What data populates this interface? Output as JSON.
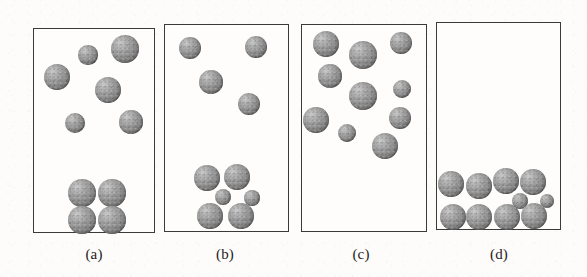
{
  "figure": {
    "width": 587,
    "height": 277,
    "background_color": "#fdfcfa",
    "panel_border_color": "#3a3a3a",
    "sphere_color": "#8d8d8d",
    "sphere_highlight_color": "#c9c9c9",
    "sphere_shadow_color": "#5e5e5e"
  },
  "panels": [
    {
      "id": "panel-a",
      "label": "(a)",
      "box": {
        "x": 33,
        "y": 28,
        "w": 122,
        "h": 205
      },
      "label_pos": {
        "x": 94,
        "y": 246
      },
      "particle_count": 10,
      "particles": [
        {
          "cx": 88,
          "cy": 55,
          "r": 9.7,
          "group": "dispersed"
        },
        {
          "cx": 125,
          "cy": 49,
          "r": 14,
          "group": "dispersed"
        },
        {
          "cx": 57,
          "cy": 77,
          "r": 13.3,
          "group": "dispersed"
        },
        {
          "cx": 108,
          "cy": 90,
          "r": 13.3,
          "group": "dispersed"
        },
        {
          "cx": 75,
          "cy": 123,
          "r": 10,
          "group": "dispersed"
        },
        {
          "cx": 131,
          "cy": 122,
          "r": 11.7,
          "group": "dispersed"
        },
        {
          "cx": 82,
          "cy": 193,
          "r": 13.7,
          "group": "sediment"
        },
        {
          "cx": 112,
          "cy": 193,
          "r": 13.7,
          "group": "sediment"
        },
        {
          "cx": 82,
          "cy": 220,
          "r": 13.7,
          "group": "sediment"
        },
        {
          "cx": 112,
          "cy": 220,
          "r": 13.7,
          "group": "sediment"
        }
      ]
    },
    {
      "id": "panel-b",
      "label": "(b)",
      "box": {
        "x": 164,
        "y": 24,
        "w": 125,
        "h": 208
      },
      "label_pos": {
        "x": 225,
        "y": 246
      },
      "particle_count": 10,
      "particles": [
        {
          "cx": 190,
          "cy": 48,
          "r": 11.3,
          "group": "dispersed"
        },
        {
          "cx": 256,
          "cy": 47,
          "r": 11.3,
          "group": "dispersed"
        },
        {
          "cx": 211,
          "cy": 82,
          "r": 11.8,
          "group": "dispersed"
        },
        {
          "cx": 249,
          "cy": 104,
          "r": 11.3,
          "group": "dispersed"
        },
        {
          "cx": 207,
          "cy": 178,
          "r": 12.7,
          "group": "sediment"
        },
        {
          "cx": 237,
          "cy": 177,
          "r": 13.2,
          "group": "sediment"
        },
        {
          "cx": 223,
          "cy": 197,
          "r": 8,
          "group": "sediment"
        },
        {
          "cx": 252,
          "cy": 198,
          "r": 7.6,
          "group": "sediment"
        },
        {
          "cx": 210,
          "cy": 216,
          "r": 12.7,
          "group": "sediment"
        },
        {
          "cx": 241,
          "cy": 216,
          "r": 13.2,
          "group": "sediment"
        }
      ]
    },
    {
      "id": "panel-c",
      "label": "(c)",
      "box": {
        "x": 301,
        "y": 24,
        "w": 126,
        "h": 208
      },
      "label_pos": {
        "x": 361,
        "y": 246
      },
      "particle_count": 10,
      "particles": [
        {
          "cx": 326,
          "cy": 44,
          "r": 13.3,
          "group": "dispersed"
        },
        {
          "cx": 363,
          "cy": 55,
          "r": 14,
          "group": "dispersed"
        },
        {
          "cx": 401,
          "cy": 43,
          "r": 11.3,
          "group": "dispersed"
        },
        {
          "cx": 330,
          "cy": 76,
          "r": 11.7,
          "group": "dispersed"
        },
        {
          "cx": 363,
          "cy": 96,
          "r": 14,
          "group": "dispersed"
        },
        {
          "cx": 402,
          "cy": 89,
          "r": 9,
          "group": "dispersed"
        },
        {
          "cx": 316,
          "cy": 120,
          "r": 12.7,
          "group": "dispersed"
        },
        {
          "cx": 347,
          "cy": 133,
          "r": 9.3,
          "group": "dispersed"
        },
        {
          "cx": 400,
          "cy": 118,
          "r": 11.3,
          "group": "dispersed"
        },
        {
          "cx": 385,
          "cy": 146,
          "r": 13.3,
          "group": "dispersed"
        }
      ]
    },
    {
      "id": "panel-d",
      "label": "(d)",
      "box": {
        "x": 436,
        "y": 22,
        "w": 125,
        "h": 208
      },
      "label_pos": {
        "x": 499,
        "y": 246
      },
      "particle_count": 10,
      "particles": [
        {
          "cx": 451,
          "cy": 184,
          "r": 12.7,
          "group": "sediment"
        },
        {
          "cx": 479,
          "cy": 186,
          "r": 12.7,
          "group": "sediment"
        },
        {
          "cx": 506,
          "cy": 181,
          "r": 12.7,
          "group": "sediment"
        },
        {
          "cx": 533,
          "cy": 182,
          "r": 12.7,
          "group": "sediment"
        },
        {
          "cx": 520,
          "cy": 201,
          "r": 8,
          "group": "sediment"
        },
        {
          "cx": 547,
          "cy": 201,
          "r": 7.3,
          "group": "sediment"
        },
        {
          "cx": 453,
          "cy": 217,
          "r": 13,
          "group": "sediment"
        },
        {
          "cx": 479,
          "cy": 217,
          "r": 13,
          "group": "sediment"
        },
        {
          "cx": 507,
          "cy": 217,
          "r": 13,
          "group": "sediment"
        },
        {
          "cx": 534,
          "cy": 216,
          "r": 13,
          "group": "sediment"
        }
      ]
    }
  ]
}
